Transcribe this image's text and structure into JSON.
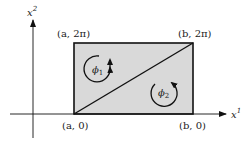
{
  "diagram": {
    "axes": {
      "x_label": "x",
      "x_label_sup": "1",
      "y_label": "x",
      "y_label_sup": "2"
    },
    "corners": {
      "top_left": "(a, 2π)",
      "top_right": "(b, 2π)",
      "bottom_left": "(a, 0)",
      "bottom_right": "(b, 0)"
    },
    "regions": [
      {
        "symbol": "ϕ",
        "subscript": "1"
      },
      {
        "symbol": "ϕ",
        "subscript": "2"
      }
    ],
    "colors": {
      "fill": "#d9d9d9",
      "stroke": "#111111"
    }
  }
}
